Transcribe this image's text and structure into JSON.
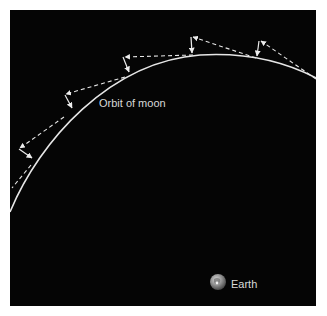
{
  "diagram": {
    "title": "",
    "labels": {
      "orbit": "Orbit of moon",
      "earth": "Earth"
    },
    "colors": {
      "background": "#050505",
      "frame": "#ffffff",
      "orbit_line": "#e6e6e6",
      "tangent_dashes": "#e6e6e6",
      "text": "#d8d8d8"
    },
    "elements": [
      {
        "type": "curve",
        "name": "moon-orbit-arc",
        "description": "curved path of the moon's orbit"
      },
      {
        "type": "dashed-arrows",
        "name": "tangent-velocity-arrows",
        "count": 5,
        "description": "dashed straight-line (tangent) motion segments"
      },
      {
        "type": "arrows",
        "name": "fall-arrows",
        "count": 5,
        "description": "short arrows showing the moon falling toward Earth back onto the orbit"
      },
      {
        "type": "sphere",
        "name": "earth",
        "description": "Earth shown as small grey globe"
      }
    ]
  }
}
